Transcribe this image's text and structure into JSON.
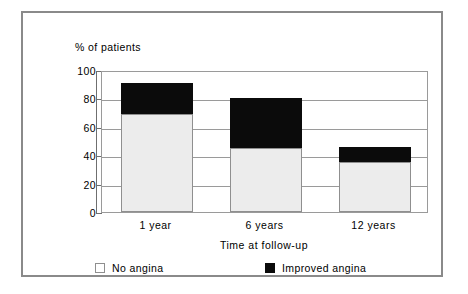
{
  "figure": {
    "frame_color": "#8a8a8a",
    "background": "#ffffff"
  },
  "chart_data": {
    "type": "bar",
    "subtype": "stacked-bar",
    "title": "",
    "xlabel": "Time at follow-up",
    "ylabel": "% of patients",
    "categories": [
      "1 year",
      "6 years",
      "12 years"
    ],
    "series": [
      {
        "name": "No angina",
        "color": "#ececec",
        "values": [
          69,
          45,
          35
        ]
      },
      {
        "name": "Improved angina",
        "color": "#0b0b0b",
        "values": [
          22,
          35,
          11
        ]
      }
    ],
    "totals": [
      91,
      80,
      46
    ],
    "ylim": [
      0,
      100
    ],
    "yticks": [
      0,
      20,
      40,
      60,
      80,
      100
    ],
    "ytick_labels": [
      "0",
      "20",
      "40",
      "60",
      "80",
      "100"
    ],
    "grid": true,
    "grid_axis": "y",
    "legend_position": "bottom"
  },
  "axis": {
    "y_caption": "% of patients",
    "x_caption": "Time at follow-up"
  },
  "legend": {
    "items": [
      {
        "label": "No angina",
        "swatch": "light-swatch-icon"
      },
      {
        "label": "Improved angina",
        "swatch": "dark-swatch-icon"
      }
    ]
  }
}
